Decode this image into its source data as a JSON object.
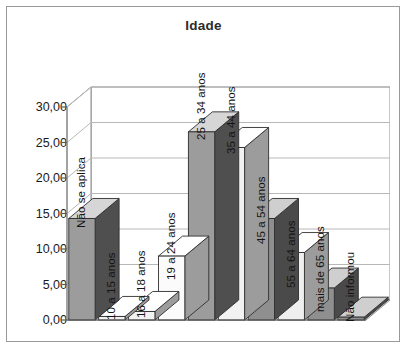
{
  "frame": {
    "border_color": "#9a9a9a"
  },
  "chart_data": {
    "type": "bar",
    "title": "Idade",
    "xlabel": "",
    "ylabel": "",
    "ylim": [
      0,
      30
    ],
    "ytick_labels": [
      "0,00",
      "5,00",
      "10,00",
      "15,00",
      "20,00",
      "25,00",
      "30,00"
    ],
    "ytick_values": [
      0,
      5,
      10,
      15,
      20,
      25,
      30
    ],
    "grid": true,
    "legend": "none",
    "style": "3d-column",
    "categories": [
      "Não se aplica",
      "10 a 15 anos",
      "16 a 18 anos",
      "19 a 24 anos",
      "25 a 34 anos",
      "35 a 44 anos",
      "45 a 54 anos",
      "55 a 64 anos",
      "mais de 65 anos",
      "Não informou"
    ],
    "values": [
      14.3,
      0.5,
      1.2,
      9.0,
      26.5,
      24.3,
      14.3,
      9.5,
      4.5,
      0.4
    ],
    "bar_colors": [
      "#9c9c9c",
      "#f2f2f2",
      "#f2f2f2",
      "#fbfbfb",
      "#9c9c9c",
      "#f2f2f2",
      "#8f8f8f",
      "#efefef",
      "#8f8f8f",
      "#8f8f8f"
    ],
    "side_colors": [
      "#4f4f4f",
      "#9c9c9c",
      "#9c9c9c",
      "#9c9c9c",
      "#4f4f4f",
      "#9c9c9c",
      "#4a4a4a",
      "#9c9c9c",
      "#4a4a4a",
      "#4a4a4a"
    ],
    "top_colors": [
      "#d6d6d6",
      "#ffffff",
      "#ffffff",
      "#ffffff",
      "#d6d6d6",
      "#ffffff",
      "#cfcfcf",
      "#ffffff",
      "#cfcfcf",
      "#cfcfcf"
    ],
    "grid_color": "#b8b8b8",
    "axis_color": "#8c8c8c",
    "floor_color": "#efefef",
    "wall_color": "#ffffff"
  }
}
